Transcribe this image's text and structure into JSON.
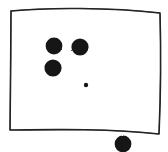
{
  "canvas": {
    "width": 168,
    "height": 152,
    "background_color": "#ffffff",
    "style": "hand-drawn-sketch"
  },
  "frame": {
    "name": "rectangle-outline",
    "stroke_color": "#1a1a1a",
    "fill_color": "none",
    "stroke_width": 1.6,
    "corners": {
      "top_left": {
        "x": 11,
        "y": 11
      },
      "top_right": {
        "x": 160,
        "y": 13
      },
      "bottom_right": {
        "x": 159,
        "y": 134
      },
      "bottom_left": {
        "x": 10,
        "y": 130
      }
    },
    "path": "M 11 11 C 45 7.5, 110 7.2, 160 13 C 161 50, 160.5 100, 159 134 C 110 128.5, 52 129.5, 10 130 C 10.5 95, 10.8 50, 11 11 Z"
  },
  "dots": [
    {
      "name": "dot-upper-left",
      "cx": 54,
      "cy": 46,
      "r": 8.4,
      "color": "#171717",
      "inside_frame": true
    },
    {
      "name": "dot-upper-right",
      "cx": 80,
      "cy": 47,
      "r": 8.6,
      "color": "#171717",
      "inside_frame": true
    },
    {
      "name": "dot-middle-left",
      "cx": 53,
      "cy": 68,
      "r": 8.6,
      "color": "#171717",
      "inside_frame": true
    },
    {
      "name": "dot-tiny-center",
      "cx": 86,
      "cy": 85,
      "r": 2.2,
      "color": "#171717",
      "inside_frame": true
    },
    {
      "name": "dot-outside-bottom-right",
      "cx": 123,
      "cy": 144,
      "r": 8.4,
      "color": "#171717",
      "inside_frame": false
    }
  ],
  "summary": {
    "dot_count_inside": 4,
    "dot_count_outside": 1,
    "dot_count_total": 5
  }
}
